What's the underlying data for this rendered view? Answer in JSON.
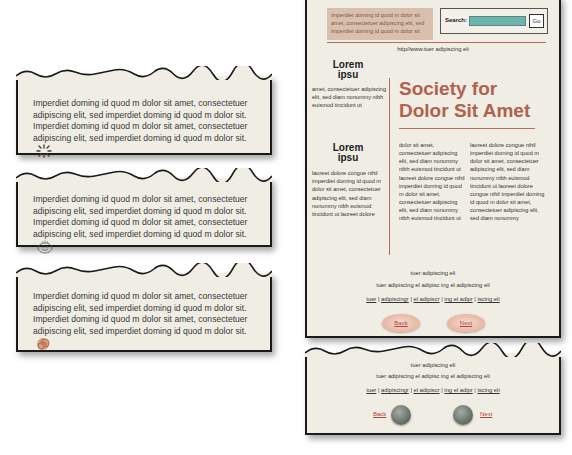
{
  "cards": [
    {
      "text": "Imperdiet doming id quod m dolor sit amet, consectetuer adipiscing elit, sed imperdiet doming id quod m dolor sit. Imperdiet doming id quod m dolor sit amet, consectetuer adipiscing elit, sed imperdiet doming id quod m dolor sit.",
      "icon": "sparkle-icon"
    },
    {
      "text": "Imperdiet doming id quod m dolor sit amet, consectetuer adipiscing elit, sed imperdiet doming id quod m dolor sit. Imperdiet doming id quod m dolor sit amet, consectetuer adipiscing elit, sed imperdiet doming id quod m dolor sit.",
      "icon": "smiley-doodle-icon"
    },
    {
      "text": "Imperdiet doming id quod m dolor sit amet, consectetuer adipiscing elit, sed imperdiet doming id quod m dolor sit. Imperdiet doming id quod m dolor sit amet, consectetuer adipiscing elit, sed imperdiet doming id quod m dolor sit.",
      "icon": "spiral-shell-icon"
    }
  ],
  "site": {
    "header_blurb": "imperdiet doming id quod m dolor sit amet, consectetuer adipiscing elit, sed imperdiet doming id quod m dolor sit",
    "search": {
      "label": "Search:",
      "value": "",
      "go_label": "Go"
    },
    "url": "http//www.tuer adipiscing eli",
    "sidebar": [
      {
        "heading_line1": "Lorem",
        "heading_line2": "ipsu",
        "text": "amet, consectetuer adipiscing elit, sed diam nonummy nibh euismod tincidunt ut"
      },
      {
        "heading_line1": "Lorem",
        "heading_line2": "ipsu",
        "text": "laoreet dolore congue nihil imperdiet doming id quod m dolor sit amet, consectetuer adipiscing elit, sed diam nonummy nibh euismod tincidunt ut laoreet dolore"
      }
    ],
    "title_line1": "Society for",
    "title_line2": "Dolor Sit Amet",
    "columns": [
      "dolor sit amet, consectetuer adipiscing elit, sed diam nonummy nibh euismod tincidunt ut laoreet dolore congue nihil imperdiet doming id quod m dolor sit amet, consectetuer adipiscing elit, sed diam nonummy nibh euismod tincidunt ut",
      "laoreet dolore congue nihil imperdiet doming id quod m dolor sit amet, consectetuer adipiscing elit, sed diam nonummy nibh euismod tincidunt ut laoreet dolore congue nihil imperdiet doming id quod m dolor sit amet, consectetuer adipiscing elit, sed diam nonummy"
    ],
    "footer_line1": "tuer adipiscing eli",
    "footer_line2": "tuer adipiscing el adipisc ing el adipiscing eli",
    "links": [
      "tuer",
      "adipiscingr",
      "el adipiscr",
      "ing el adipr",
      "iscing eli"
    ],
    "back_label": "Back",
    "next_label": "Next"
  },
  "bottom_nav": {
    "footer_line1": "tuer adipiscing eli",
    "footer_line2": "tuer adipiscing el adipisc ing el adipiscing eli",
    "links": [
      "tuer",
      "adipiscingr",
      "el adipiscr",
      "ing el adipr",
      "iscing eli"
    ],
    "back_label": "Back",
    "next_label": "Next"
  }
}
